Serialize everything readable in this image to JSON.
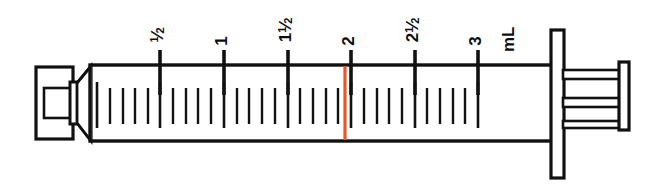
{
  "figure": {
    "width": 651,
    "height": 188,
    "background_color": "#ffffff",
    "line_color": "#111111",
    "marker_color": "#ee5521",
    "unit_label": "mL",
    "device": "3 mL syringe"
  },
  "scale": {
    "unit": "mL",
    "min_value": 0,
    "max_value": 3,
    "minor_increment": 0.1,
    "major_increment": 0.5,
    "labeled_ticks": [
      {
        "value": 0.5,
        "label_whole": "",
        "label_num": "1",
        "label_den": "2",
        "x": 160
      },
      {
        "value": 1.0,
        "label_whole": "1",
        "label_num": "",
        "label_den": "",
        "x": 224
      },
      {
        "value": 1.5,
        "label_whole": "1",
        "label_num": "1",
        "label_den": "2",
        "x": 288
      },
      {
        "value": 2.0,
        "label_whole": "2",
        "label_num": "",
        "label_den": "",
        "x": 351
      },
      {
        "value": 2.5,
        "label_whole": "2",
        "label_num": "1",
        "label_den": "2",
        "x": 415
      },
      {
        "value": 3.0,
        "label_whole": "3",
        "label_num": "",
        "label_den": "",
        "x": 478
      }
    ],
    "unit_label_x": 510
  },
  "marker": {
    "name": "dose-indicator-line",
    "color": "#ee5521",
    "x": 345,
    "value": 1.95,
    "description": "orange vertical measurement line just left of the 2 mL graduation"
  },
  "parts": {
    "tip": "luer-lock-tip",
    "collar": "tip-collar",
    "taper": "barrel-taper",
    "barrel": "syringe-barrel",
    "flange": "barrel-flange",
    "plunger_rod": "plunger-rod",
    "thumb_pad": "plunger-thumb-pad"
  }
}
